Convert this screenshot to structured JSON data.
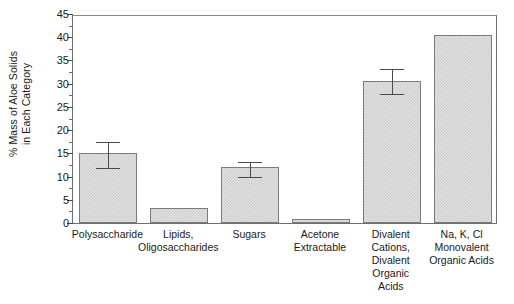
{
  "chart_data": {
    "type": "bar",
    "title": "",
    "xlabel": "",
    "ylabel": "% Mass of Aloe Solids\nin Each Category",
    "ylim": [
      0,
      45
    ],
    "ytick_step": 5,
    "yticks": [
      "0",
      "5",
      "10",
      "15",
      "20",
      "25",
      "30",
      "35",
      "40",
      "45"
    ],
    "grid": false,
    "legend": "none",
    "categories": [
      "Polysaccharide",
      "Lipids,\nOligosaccharides",
      "Sugars",
      "Acetone\nExtractable",
      "Divalent\nCations,\nDivalent\nOrganic\nAcids",
      "Na, K, Cl\nMonovalent\nOrganic Acids"
    ],
    "values": [
      15.0,
      3.2,
      12.0,
      0.8,
      30.6,
      40.4
    ],
    "errors_low": [
      11.6,
      null,
      9.6,
      null,
      27.6,
      null
    ],
    "errors_high": [
      17.2,
      null,
      12.9,
      null,
      33.0,
      null
    ],
    "bar_fill_color": "#e2e2e2",
    "bar_edge_color": "#7b7b7b",
    "axis_color": "#6f6f6f",
    "text_color": "#1a1a1a",
    "background_color": "#ffffff"
  }
}
